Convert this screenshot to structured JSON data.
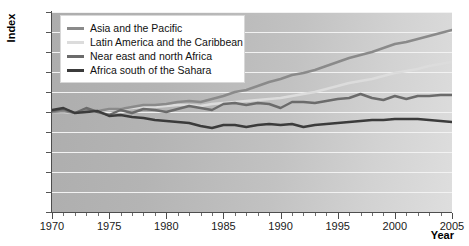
{
  "chart_data": {
    "type": "line",
    "title": "",
    "xlabel": "Year",
    "ylabel": "Index",
    "xlim": [
      1970,
      2005
    ],
    "ylim": [
      0,
      200
    ],
    "ytick_step": 20,
    "xtick_step": 5,
    "grid": true,
    "legend_position": "top-left",
    "x": [
      1970,
      1971,
      1972,
      1973,
      1974,
      1975,
      1976,
      1977,
      1978,
      1979,
      1980,
      1981,
      1982,
      1983,
      1984,
      1985,
      1986,
      1987,
      1988,
      1989,
      1990,
      1991,
      1992,
      1993,
      1994,
      1995,
      1996,
      1997,
      1998,
      1999,
      2000,
      2001,
      2002,
      2003,
      2004,
      2005
    ],
    "xticklabels": [
      "1970",
      "1975",
      "1980",
      "1985",
      "1990",
      "1995",
      "2000",
      "2005"
    ],
    "yticklabels": [
      "0",
      "20",
      "40",
      "60",
      "80",
      "100",
      "120",
      "140",
      "160",
      "180",
      "200"
    ],
    "series": [
      {
        "name": "Asia and the Pacific",
        "color": "#8a8a8a",
        "values": [
          100,
          101,
          99,
          102,
          101,
          103,
          103,
          105,
          107,
          107,
          108,
          110,
          111,
          110,
          113,
          116,
          120,
          122,
          126,
          130,
          133,
          137,
          139,
          142,
          146,
          150,
          154,
          157,
          160,
          164,
          168,
          170,
          173,
          176,
          179,
          182
        ]
      },
      {
        "name": "Latin America and the Caribbean",
        "color": "#dcdcdc",
        "values": [
          100,
          100,
          99,
          101,
          101,
          102,
          103,
          104,
          105,
          105,
          106,
          107,
          107,
          106,
          108,
          109,
          110,
          111,
          112,
          113,
          114,
          116,
          118,
          120,
          123,
          126,
          129,
          131,
          133,
          136,
          139,
          141,
          143,
          146,
          148,
          150
        ]
      },
      {
        "name": "Near east and north Africa",
        "color": "#6b6b6b",
        "values": [
          101,
          103,
          99,
          104,
          100,
          97,
          102,
          99,
          103,
          102,
          100,
          103,
          106,
          104,
          102,
          108,
          109,
          107,
          109,
          108,
          104,
          110,
          110,
          109,
          111,
          113,
          114,
          118,
          114,
          112,
          116,
          113,
          116,
          116,
          117,
          117
        ]
      },
      {
        "name": "Africa south of the Sahara",
        "color": "#3b3b3b",
        "values": [
          102,
          104,
          99,
          100,
          101,
          96,
          97,
          95,
          94,
          92,
          91,
          90,
          89,
          86,
          84,
          87,
          87,
          85,
          87,
          88,
          87,
          88,
          85,
          87,
          88,
          89,
          90,
          91,
          92,
          92,
          93,
          93,
          93,
          92,
          91,
          90
        ]
      }
    ]
  },
  "legend": {
    "items": [
      {
        "label": "Asia and the Pacific"
      },
      {
        "label": "Latin America and the Caribbean"
      },
      {
        "label": "Near east and north Africa"
      },
      {
        "label": "Africa south of the Sahara"
      }
    ]
  }
}
